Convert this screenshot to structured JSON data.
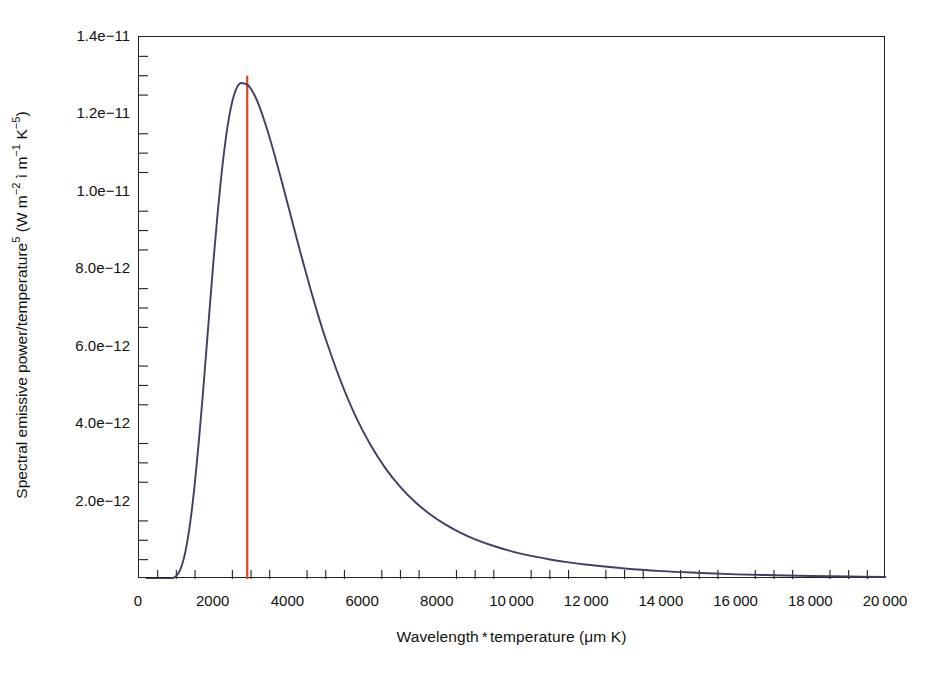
{
  "chart_data": {
    "type": "line",
    "title": "",
    "subtitle": "",
    "xlabel": "Wavelength * temperature (μm K)",
    "ylabel": "Spectral emissive power/temperature5 (W m-2 ì m-1 K-5)",
    "ylabel_parts": {
      "base1": "Spectral emissive power/temperature",
      "sup1": "5",
      "base2": " (W m",
      "sup2": "−2",
      "base3": " ì m",
      "sup3": "−1",
      "base4": " K",
      "sup4": "−5",
      "base5": ")"
    },
    "xlabel_parts": {
      "base1": "Wavelength",
      "sep": "*",
      "base2": "temperature (μm K)"
    },
    "grid": false,
    "legend": "none",
    "xlim": [
      0,
      20000
    ],
    "ylim": [
      0,
      1.4e-11
    ],
    "xticks": [
      0,
      2000,
      4000,
      6000,
      8000,
      10000,
      12000,
      14000,
      16000,
      18000,
      20000
    ],
    "xtick_labels": [
      "0",
      "2000",
      "4000",
      "6000",
      "8000",
      "10 000",
      "12 000",
      "14 000",
      "16 000",
      "18 000",
      "20 000"
    ],
    "x_minor_tick_interval": 500,
    "yticks": [
      2e-12,
      4e-12,
      6e-12,
      8e-12,
      1e-11,
      1.2e-11,
      1.4e-11
    ],
    "ytick_labels": [
      "2.0e−12",
      "4.0e−12",
      "6.0e−12",
      "8.0e−12",
      "1.0e−11",
      "1.2e−11",
      "1.4e−11"
    ],
    "y_minor_tick_interval": 5e-13,
    "series": [
      {
        "name": "Planck spectral emissive power",
        "color": "#3f3f63",
        "line_width": 1.9,
        "x": [
          200,
          400,
          600,
          700,
          800,
          900,
          1000,
          1100,
          1200,
          1300,
          1400,
          1500,
          1600,
          1700,
          1800,
          1900,
          2000,
          2100,
          2200,
          2300,
          2400,
          2500,
          2600,
          2700,
          2800,
          2898,
          3000,
          3100,
          3200,
          3400,
          3600,
          3800,
          4000,
          4200,
          4400,
          4600,
          4800,
          5000,
          5400,
          5800,
          6200,
          6600,
          7000,
          7400,
          7800,
          8200,
          8600,
          9000,
          9500,
          10000,
          10500,
          11000,
          11500,
          12000,
          13000,
          14000,
          15000,
          16000,
          17000,
          18000,
          19000,
          20000
        ],
        "y": [
          0.0,
          0.0,
          1e-16,
          3.6e-15,
          4.2e-14,
          2.6e-13,
          1.05e-12,
          3.06e-12,
          7e-12,
          1.33e-11,
          2.21e-11,
          3.34e-11,
          4.68e-11,
          6.18e-11,
          7.78e-11,
          9.4e-11,
          1.098e-10,
          1.245e-10,
          1.375e-10,
          1.485e-10,
          1.573e-10,
          1.637e-10,
          1.678e-10,
          1.697e-10,
          1.697e-10,
          1.693e-10,
          1.678e-10,
          1.655e-10,
          1.626e-10,
          1.552e-10,
          1.466e-10,
          1.372e-10,
          1.275e-10,
          1.177e-10,
          1.081e-10,
          9.89e-11,
          9.02e-11,
          8.21e-11,
          6.78e-11,
          5.57e-11,
          4.59e-11,
          3.79e-11,
          3.15e-11,
          2.63e-11,
          2.21e-11,
          1.87e-11,
          1.59e-11,
          1.36e-11,
          1.13e-11,
          9.4e-12,
          7.9e-12,
          6.7e-12,
          5.7e-12,
          4.9e-12,
          3.6e-12,
          2.7e-12,
          2.1e-12,
          1.6e-12,
          1.3e-12,
          1.05e-12,
          8.6e-13,
          7.1e-13
        ]
      }
    ],
    "annotations": [
      {
        "name": "wien-peak-line",
        "type": "vline",
        "x": 2898,
        "label": "",
        "color": "#e2431f",
        "line_width": 2.2,
        "y_top": 1.3e-11,
        "y_bottom": 0.0
      }
    ],
    "peak": {
      "x": 2898,
      "y": 1.28e-11
    },
    "colors": {
      "curve": "#3f3f63",
      "marker_line": "#e2431f",
      "axis": "#231f20",
      "background": "#ffffff",
      "text": "#111111"
    }
  }
}
